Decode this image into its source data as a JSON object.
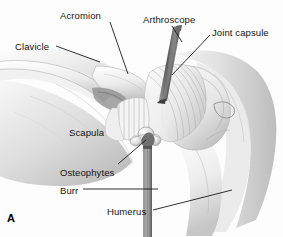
{
  "figure": {
    "panel_letter": "A",
    "background_color": "#fdfdfd",
    "label_color": "#141414",
    "leader_color": "#1a1a1a"
  },
  "labels": [
    {
      "id": "acromion",
      "text": "Acromion",
      "x": 60,
      "y": 11
    },
    {
      "id": "arthroscope",
      "text": "Arthroscope",
      "x": 143,
      "y": 15
    },
    {
      "id": "joint_capsule",
      "text": "Joint capsule",
      "x": 212,
      "y": 28
    },
    {
      "id": "clavicle",
      "text": "Clavicle",
      "x": 15,
      "y": 42
    },
    {
      "id": "scapula",
      "text": "Scapula",
      "x": 69,
      "y": 128
    },
    {
      "id": "osteophytes",
      "text": "Osteophytes",
      "x": 60,
      "y": 168
    },
    {
      "id": "burr",
      "text": "Burr",
      "x": 60,
      "y": 186
    },
    {
      "id": "humerus",
      "text": "Humerus",
      "x": 107,
      "y": 207
    }
  ],
  "leader_lines": [
    {
      "id": "acromion-leader",
      "x1": 110,
      "y1": 22,
      "x2": 128,
      "y2": 74
    },
    {
      "id": "arthroscope-leader",
      "x1": 172,
      "y1": 26,
      "x2": 182,
      "y2": 42
    },
    {
      "id": "joint-capsule-leader",
      "x1": 210,
      "y1": 35,
      "x2": 172,
      "y2": 75
    },
    {
      "id": "clavicle-leader",
      "x1": 56,
      "y1": 46,
      "x2": 100,
      "y2": 62
    },
    {
      "id": "osteophytes-leader",
      "x1": 118,
      "y1": 164,
      "x2": 146,
      "y2": 140
    },
    {
      "id": "burr-leader",
      "x1": 83,
      "y1": 189,
      "x2": 158,
      "y2": 189
    },
    {
      "id": "humerus-leader",
      "x1": 153,
      "y1": 210,
      "x2": 232,
      "y2": 190
    }
  ],
  "anatomy_parts": [
    {
      "id": "deltoid-soft-tissue",
      "name": "deltoid-and-shoulder-contour"
    },
    {
      "id": "scapula-body",
      "name": "scapula-body"
    },
    {
      "id": "clavicle-bone",
      "name": "clavicle-bone"
    },
    {
      "id": "acromion-process",
      "name": "acromion-process"
    },
    {
      "id": "humeral-head",
      "name": "humeral-head"
    },
    {
      "id": "humerus-shaft",
      "name": "humerus-shaft"
    },
    {
      "id": "joint-capsule-fibers",
      "name": "joint-capsule-striations"
    },
    {
      "id": "osteophyte-nodule",
      "name": "osteophyte-nodule"
    },
    {
      "id": "arthroscope-tool",
      "name": "arthroscope-instrument"
    },
    {
      "id": "burr-tool",
      "name": "burr-instrument"
    }
  ]
}
